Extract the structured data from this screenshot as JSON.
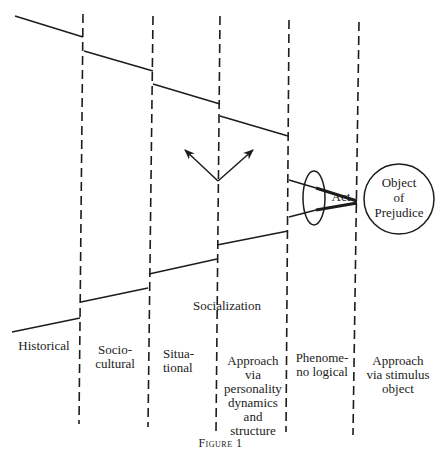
{
  "figure": {
    "caption": "Figure 1",
    "columns": [
      {
        "id": "historical",
        "label": "Historical"
      },
      {
        "id": "sociocultural",
        "label": "Socio-\ncultural"
      },
      {
        "id": "situational",
        "label": "Situa-\ntional"
      },
      {
        "id": "personality",
        "label": "Approach\nvia\npersonality\ndynamics\nand\nstructure"
      },
      {
        "id": "phenomenological",
        "label": "Phenome-\nno logical"
      },
      {
        "id": "stimulus",
        "label": "Approach\nvia stimulus\nobject"
      }
    ],
    "socialization_label": "Socialization",
    "act_label": "Act",
    "object_label": "Object\nof\nPrejudice"
  }
}
